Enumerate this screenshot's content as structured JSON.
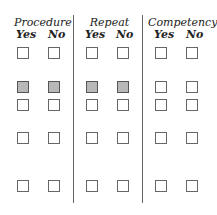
{
  "groups": [
    {
      "title": "Procedure",
      "options": [
        "Yes",
        "No"
      ]
    },
    {
      "title": "Repeat",
      "options": [
        "Yes",
        "No"
      ]
    },
    {
      "title": "Competency",
      "options": [
        "Yes",
        "No"
      ]
    }
  ],
  "rows": [
    {
      "shaded": false
    },
    {
      "shaded": true,
      "shaded_columns": [
        "procedure-yes",
        "procedure-no",
        "repeat-yes",
        "repeat-no"
      ]
    },
    {
      "shaded": false
    },
    {
      "shaded": false
    },
    {
      "shaded": false
    }
  ],
  "colors": {
    "shaded_fill": "#b8b8b8",
    "border": "#666666"
  }
}
